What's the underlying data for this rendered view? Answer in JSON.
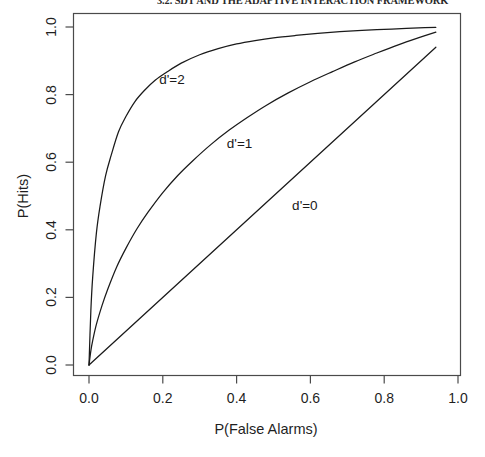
{
  "page_header": {
    "text": "3.2. SDT AND THE ADAPTIVE INTERACTION FRAMEWORK"
  },
  "chart_data": {
    "type": "line",
    "title": "",
    "subtitle": "",
    "xlabel": "P(False Alarms)",
    "ylabel": "P(Hits)",
    "xlim": [
      0.0,
      1.0
    ],
    "ylim": [
      0.0,
      1.0
    ],
    "xticks": [
      "0.0",
      "0.2",
      "0.4",
      "0.6",
      "0.8",
      "1.0"
    ],
    "xtick_values": [
      0.0,
      0.2,
      0.4,
      0.6,
      0.8,
      1.0
    ],
    "yticks": [
      "0.0",
      "0.2",
      "0.4",
      "0.6",
      "0.8",
      "1.0"
    ],
    "ytick_values": [
      0.0,
      0.2,
      0.4,
      0.6,
      0.8,
      1.0
    ],
    "grid": false,
    "legend_position": "inline-annotations",
    "line_color": "#1a1a1a",
    "background_color": "#ffffff",
    "series": [
      {
        "name": "d'=2",
        "label": "d'=2",
        "label_x": 0.225,
        "label_y": 0.845,
        "x": [
          0.0,
          0.005,
          0.01,
          0.02,
          0.03,
          0.045,
          0.06,
          0.08,
          0.1,
          0.125,
          0.15,
          0.18,
          0.21,
          0.25,
          0.3,
          0.35,
          0.4,
          0.45,
          0.5,
          0.56,
          0.62,
          0.68,
          0.74,
          0.8,
          0.86,
          0.91,
          0.94
        ],
        "y": [
          0.0,
          0.16,
          0.26,
          0.39,
          0.47,
          0.56,
          0.62,
          0.69,
          0.735,
          0.78,
          0.812,
          0.843,
          0.866,
          0.893,
          0.918,
          0.936,
          0.95,
          0.96,
          0.968,
          0.975,
          0.981,
          0.986,
          0.99,
          0.993,
          0.996,
          0.998,
          0.999
        ]
      },
      {
        "name": "d'=1",
        "label": "d'=1",
        "label_x": 0.408,
        "label_y": 0.657,
        "x": [
          0.0,
          0.005,
          0.01,
          0.02,
          0.035,
          0.05,
          0.075,
          0.1,
          0.13,
          0.16,
          0.2,
          0.24,
          0.28,
          0.33,
          0.38,
          0.43,
          0.48,
          0.54,
          0.6,
          0.66,
          0.72,
          0.78,
          0.84,
          0.89,
          0.94
        ],
        "y": [
          0.0,
          0.042,
          0.072,
          0.12,
          0.175,
          0.222,
          0.29,
          0.345,
          0.403,
          0.452,
          0.51,
          0.56,
          0.603,
          0.652,
          0.695,
          0.733,
          0.768,
          0.805,
          0.838,
          0.868,
          0.897,
          0.923,
          0.948,
          0.967,
          0.985
        ]
      },
      {
        "name": "d'=0",
        "label": "d'=0",
        "label_x": 0.585,
        "label_y": 0.472,
        "x": [
          0.0,
          0.94
        ],
        "y": [
          0.0,
          0.94
        ]
      }
    ]
  }
}
